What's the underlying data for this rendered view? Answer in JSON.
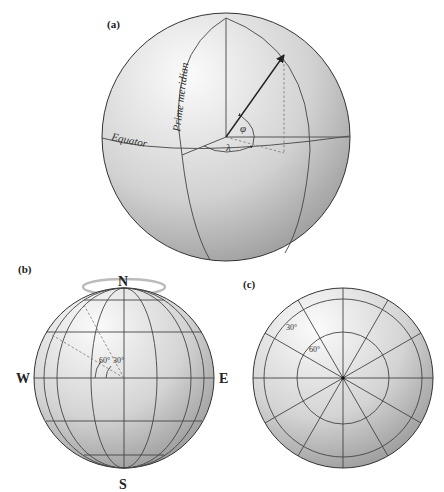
{
  "figure": {
    "panels": [
      {
        "id": "a",
        "label": "(a)",
        "annotations": {
          "equator": "Equator",
          "prime_meridian": "Prime meridian",
          "latitude_symbol": "φ",
          "longitude_symbol": "λ"
        }
      },
      {
        "id": "b",
        "label": "(b)",
        "compass": {
          "north": "N",
          "south": "S",
          "west": "W",
          "east": "E"
        },
        "angles": [
          "60°",
          "30°"
        ]
      },
      {
        "id": "c",
        "label": "(c)",
        "circles": [
          "30°",
          "60°"
        ]
      }
    ]
  },
  "colors": {
    "sphere_light": "#f4f4f4",
    "sphere_dark": "#9a9a9a",
    "grid_line": "#444444",
    "text": "#222222"
  }
}
